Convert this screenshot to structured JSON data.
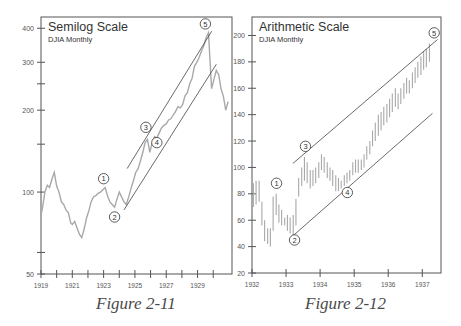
{
  "captions": {
    "left": "Figure 2-11",
    "right": "Figure 2-12"
  },
  "colors": {
    "frame": "#555555",
    "data": "#a8a8a8",
    "channel": "#444444",
    "text": "#333333",
    "tick_label": "#555555"
  },
  "chart_data": [
    {
      "type": "line",
      "title": "Semilog Scale",
      "subtitle": "DJIA Monthly",
      "y_scale": "log",
      "xlabel": "",
      "ylabel": "",
      "ylim": [
        50,
        440
      ],
      "xlim": [
        1919,
        1931.2
      ],
      "grid": false,
      "yticks": [
        50,
        100,
        200,
        300,
        400
      ],
      "yticks_minor": [
        60,
        150,
        250
      ],
      "xticks": [
        "1919",
        "1921",
        "1923",
        "1925",
        "1927",
        "1929"
      ],
      "xticks_minor": [
        1920,
        1922,
        1924,
        1926,
        1928,
        1930
      ],
      "series": [
        {
          "name": "DJIA monthly",
          "x": [
            1919.0,
            1919.1,
            1919.25,
            1919.4,
            1919.55,
            1919.7,
            1919.85,
            1920.0,
            1920.15,
            1920.3,
            1920.45,
            1920.6,
            1920.75,
            1920.9,
            1921.0,
            1921.15,
            1921.3,
            1921.45,
            1921.6,
            1921.75,
            1921.9,
            1922.05,
            1922.2,
            1922.35,
            1922.5,
            1922.65,
            1922.8,
            1922.95,
            1923.1,
            1923.25,
            1923.4,
            1923.55,
            1923.7,
            1923.85,
            1924.0,
            1924.15,
            1924.3,
            1924.45,
            1924.6,
            1924.75,
            1924.9,
            1925.05,
            1925.2,
            1925.35,
            1925.5,
            1925.65,
            1925.8,
            1925.95,
            1926.1,
            1926.25,
            1926.4,
            1926.55,
            1926.7,
            1926.85,
            1927.0,
            1927.15,
            1927.3,
            1927.45,
            1927.6,
            1927.75,
            1927.9,
            1928.05,
            1928.2,
            1928.35,
            1928.5,
            1928.65,
            1928.8,
            1928.95,
            1929.1,
            1929.25,
            1929.4,
            1929.55,
            1929.7,
            1929.8,
            1929.9,
            1930.05,
            1930.2,
            1930.35,
            1930.5,
            1930.65,
            1930.8,
            1930.95
          ],
          "values": [
            82,
            88,
            100,
            106,
            104,
            112,
            118,
            105,
            100,
            92,
            90,
            86,
            84,
            77,
            76,
            78,
            74,
            70,
            68,
            73,
            80,
            85,
            92,
            96,
            97,
            99,
            100,
            102,
            104,
            97,
            92,
            90,
            88,
            94,
            100,
            96,
            92,
            90,
            96,
            103,
            110,
            118,
            122,
            130,
            140,
            152,
            156,
            140,
            152,
            160,
            158,
            165,
            172,
            176,
            178,
            184,
            186,
            192,
            198,
            206,
            204,
            210,
            226,
            232,
            250,
            262,
            290,
            300,
            312,
            330,
            345,
            370,
            385,
            300,
            240,
            260,
            280,
            270,
            240,
            225,
            200,
            215
          ]
        }
      ],
      "channel_lines": [
        {
          "name": "upper",
          "from": [
            1924.5,
            122
          ],
          "to": [
            1929.9,
            390
          ]
        },
        {
          "name": "lower",
          "from": [
            1924.3,
            86
          ],
          "to": [
            1930.2,
            295
          ]
        }
      ],
      "annotations": [
        {
          "label": "1",
          "x": 1923.0,
          "y": 112
        },
        {
          "label": "2",
          "x": 1923.7,
          "y": 81
        },
        {
          "label": "3",
          "x": 1925.7,
          "y": 173
        },
        {
          "label": "4",
          "x": 1926.4,
          "y": 152
        },
        {
          "label": "5",
          "x": 1929.5,
          "y": 415
        }
      ]
    },
    {
      "type": "bar",
      "title": "Arithmetic Scale",
      "subtitle": "DJIA Monthly",
      "y_scale": "linear",
      "xlabel": "",
      "ylabel": "",
      "ylim": [
        20,
        214
      ],
      "xlim": [
        1932,
        1937.55
      ],
      "grid": false,
      "yticks": [
        20,
        40,
        60,
        80,
        100,
        120,
        140,
        160,
        180,
        200
      ],
      "xticks": [
        "1932",
        "1933",
        "1934",
        "1935",
        "1936",
        "1937"
      ],
      "series": [
        {
          "name": "DJIA monthly high-low range",
          "x": [
            1932.04,
            1932.12,
            1932.21,
            1932.29,
            1932.37,
            1932.46,
            1932.54,
            1932.62,
            1932.71,
            1932.79,
            1932.87,
            1932.96,
            1933.04,
            1933.12,
            1933.21,
            1933.29,
            1933.37,
            1933.46,
            1933.54,
            1933.62,
            1933.71,
            1933.79,
            1933.87,
            1933.96,
            1934.04,
            1934.12,
            1934.21,
            1934.29,
            1934.37,
            1934.46,
            1934.54,
            1934.62,
            1934.71,
            1934.79,
            1934.87,
            1934.96,
            1935.04,
            1935.12,
            1935.21,
            1935.29,
            1935.37,
            1935.46,
            1935.54,
            1935.62,
            1935.71,
            1935.79,
            1935.87,
            1935.96,
            1936.04,
            1936.12,
            1936.21,
            1936.29,
            1936.37,
            1936.46,
            1936.54,
            1936.62,
            1936.71,
            1936.79,
            1936.87,
            1936.96,
            1937.04,
            1937.12,
            1937.21
          ],
          "high": [
            88,
            90,
            90,
            74,
            60,
            54,
            54,
            78,
            80,
            72,
            68,
            62,
            64,
            62,
            64,
            76,
            92,
            100,
            108,
            104,
            98,
            98,
            100,
            104,
            110,
            108,
            104,
            100,
            98,
            94,
            92,
            90,
            94,
            96,
            98,
            104,
            106,
            106,
            106,
            110,
            116,
            120,
            128,
            134,
            140,
            142,
            146,
            148,
            152,
            156,
            160,
            156,
            160,
            164,
            168,
            166,
            172,
            176,
            180,
            184,
            188,
            190,
            194
          ],
          "low": [
            70,
            72,
            74,
            56,
            44,
            42,
            40,
            52,
            64,
            58,
            56,
            56,
            52,
            50,
            48,
            56,
            78,
            86,
            90,
            88,
            84,
            86,
            88,
            92,
            98,
            96,
            92,
            90,
            86,
            82,
            82,
            84,
            86,
            88,
            90,
            94,
            96,
            96,
            98,
            100,
            106,
            110,
            116,
            120,
            124,
            128,
            132,
            134,
            138,
            142,
            146,
            144,
            148,
            152,
            156,
            156,
            160,
            164,
            168,
            170,
            174,
            176,
            180
          ]
        }
      ],
      "channel_lines": [
        {
          "name": "upper",
          "from": [
            1933.2,
            103
          ],
          "to": [
            1937.45,
            197
          ]
        },
        {
          "name": "lower",
          "from": [
            1933.15,
            47
          ],
          "to": [
            1937.3,
            141
          ]
        }
      ],
      "annotations": [
        {
          "label": "1",
          "x": 1932.72,
          "y": 88
        },
        {
          "label": "2",
          "x": 1933.25,
          "y": 45
        },
        {
          "label": "3",
          "x": 1933.57,
          "y": 116
        },
        {
          "label": "4",
          "x": 1934.8,
          "y": 81
        },
        {
          "label": "5",
          "x": 1937.35,
          "y": 202
        }
      ]
    }
  ]
}
